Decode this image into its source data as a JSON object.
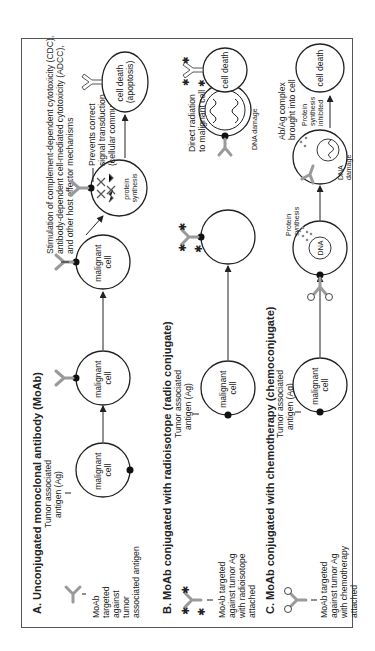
{
  "rows": {
    "A": {
      "title": "A. Unconjugated monoclonal antibody (MoAb)",
      "moab_label": [
        "MoAb",
        "targeted",
        "against",
        "tumor",
        "associated antigen"
      ],
      "ag_label": [
        "Tumor associated",
        "antigen (Ag)"
      ],
      "cells": [
        "malignant",
        "cell"
      ],
      "effector_text": [
        "Stimulation of complement-dependent cytotoxicity (CDC),",
        "antibody-dependent cell-mediated cytotoxicity (ADCC),",
        "and other host effector mechanisms"
      ],
      "signal_text": [
        "Prevents correct",
        "signal transduction",
        "(cellular communication)"
      ],
      "protein_label": [
        "protein",
        "synthesis"
      ],
      "death": [
        "cell death",
        "(apoptosis)"
      ]
    },
    "B": {
      "title": "B. MoAb conjugated with radioisotope (radio conjugate)",
      "moab_label": [
        "MoAb targeted",
        "against tumor Ag",
        "with radioisotope",
        "attached"
      ],
      "ag_label": [
        "Tumor associated",
        "antigen (Ag)"
      ],
      "cells": [
        "malignant",
        "cell"
      ],
      "radiation_text": [
        "Direct radiation",
        "to malignant cell"
      ],
      "dna_damage": "DNA damage",
      "death": "cell death"
    },
    "C": {
      "title": "C. MoAb conjugated with chemotherapy (chemoconjugate)",
      "moab_label": [
        "MoAb targeted",
        "against tumor Ag",
        "with chemotherapy",
        "attached"
      ],
      "ag_label": [
        "Tumor associated",
        "antigen (Ag)"
      ],
      "cells": [
        "malignant",
        "cell"
      ],
      "protein_label": [
        "Protein",
        "synthesis"
      ],
      "dna": "DNA",
      "dna_damage": [
        "DNA",
        "damage"
      ],
      "complex_text": [
        "Ab/Ag complex",
        "brought into cell"
      ],
      "inhibited": [
        "Protein",
        "synthesis",
        "inhibited"
      ],
      "death": "cell death"
    }
  },
  "colors": {
    "antibody": "#9a9a9a",
    "line": "#222222",
    "frame": "#555555"
  }
}
